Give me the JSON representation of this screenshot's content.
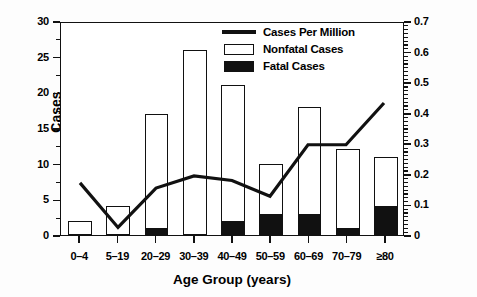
{
  "chart_data": {
    "type": "bar",
    "title": "",
    "subtitle": "",
    "xlabel": "Age Group (years)",
    "ylabel": "Cases",
    "y2label": "Cases per million population",
    "categories": [
      "0–4",
      "5–19",
      "20–29",
      "30–39",
      "40–49",
      "50–59",
      "60–69",
      "70–79",
      "≥80"
    ],
    "ylim": [
      0,
      30
    ],
    "yticks": [
      0,
      5,
      10,
      15,
      20,
      25,
      30
    ],
    "ytick_labels": [
      "0",
      "5",
      "10",
      "15",
      "20",
      "25",
      "30"
    ],
    "y2lim": [
      0,
      0.7
    ],
    "y2ticks": [
      0,
      0.1,
      0.2,
      0.3,
      0.4,
      0.5,
      0.6,
      0.7
    ],
    "y2tick_labels": [
      "0",
      "0.1",
      "0.2",
      "0.3",
      "0.4",
      "0.5",
      "0.6",
      "0.7"
    ],
    "grid": false,
    "legend_position": "top-right",
    "stacked": true,
    "series": [
      {
        "name": "Fatal Cases",
        "type": "bar",
        "axis": "left",
        "color": "#111111",
        "values": [
          0,
          0,
          1,
          0,
          2,
          3,
          3,
          1,
          4
        ]
      },
      {
        "name": "Nonfatal Cases",
        "type": "bar",
        "axis": "left",
        "color": "#ffffff",
        "values": [
          2,
          4,
          16,
          26,
          19,
          7,
          15,
          11,
          7
        ]
      },
      {
        "name": "Cases Per Million",
        "type": "line",
        "axis": "right",
        "color": "#111111",
        "values": [
          0.172,
          0.025,
          0.155,
          0.195,
          0.18,
          0.128,
          0.298,
          0.298,
          0.436
        ]
      }
    ],
    "totals": [
      2,
      4,
      17,
      26,
      21,
      10,
      18,
      12,
      11
    ]
  },
  "legend": {
    "items": [
      {
        "label": "Cases Per Million",
        "key": "line-key"
      },
      {
        "label": "Nonfatal Cases",
        "key": "open-square-key"
      },
      {
        "label": "Fatal Cases",
        "key": "filled-square-key"
      }
    ]
  }
}
